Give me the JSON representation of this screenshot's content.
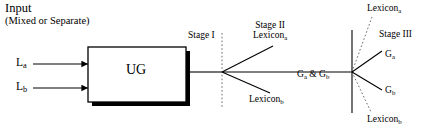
{
  "diagram": {
    "title_lines": {
      "line1": "Input",
      "line2": "(Mixed or Separate)"
    },
    "inputs": [
      {
        "name": "input-la",
        "label": "L",
        "sub": "a"
      },
      {
        "name": "input-lb",
        "label": "L",
        "sub": "b"
      }
    ],
    "processor": {
      "label": "UG"
    },
    "stages": {
      "stage1": "Stage I",
      "stage2": "Stage II",
      "stage3": "Stage III"
    },
    "branch_labels": {
      "stage2_lexicon_a": {
        "label": "Lexicon",
        "sub": "a"
      },
      "stage2_lexicon_b": {
        "label": "Lexicon",
        "sub": "b"
      },
      "trunk_ga_gb": "Gₐ & G₆",
      "trunk_ga_gb_parts": {
        "g": "G",
        "sub_a": "a",
        "amp": " & ",
        "sub_b": "b"
      },
      "stage3_lexicon_a": {
        "label": "Lexicon",
        "sub": "a"
      },
      "stage3_lexicon_b": {
        "label": "Lexicon",
        "sub": "b"
      },
      "stage3_ga": {
        "label": "G",
        "sub": "a"
      },
      "stage3_gb": {
        "label": "G",
        "sub": "b"
      }
    },
    "colors": {
      "stroke": "#000000",
      "background": "#ffffff",
      "shadow": "#000000",
      "dotted": "#6b6b6b"
    }
  }
}
